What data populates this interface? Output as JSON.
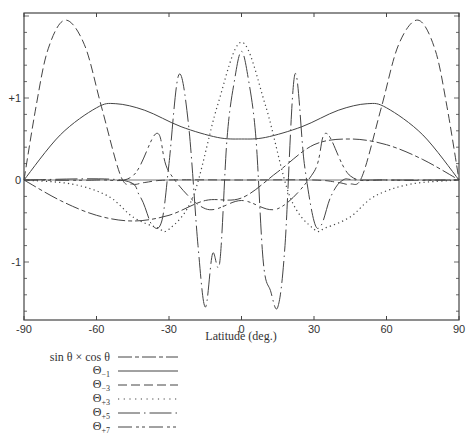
{
  "chart_data": {
    "type": "line",
    "title": "",
    "xlabel": "Latitude (deg.)",
    "ylabel": "",
    "xlim": [
      -90,
      90
    ],
    "ylim": [
      -1.7,
      2.05
    ],
    "grid": false,
    "legend_position": "below-left",
    "x_ticks": [
      -90,
      -60,
      -30,
      0,
      30,
      60,
      90
    ],
    "x_tick_labels": [
      "-90",
      "-60",
      "-30",
      "0",
      "30",
      "60",
      "90"
    ],
    "y_ticks": [
      1,
      0,
      -1
    ],
    "y_tick_labels": [
      "+1",
      "0",
      "-1"
    ],
    "series": [
      {
        "name": "sin θ × cos θ",
        "style": "dash-longshort",
        "x": [
          -90,
          -75,
          -60,
          -45,
          -30,
          -15,
          0,
          15,
          30,
          45,
          60,
          75,
          90
        ],
        "values": [
          0,
          -0.25,
          -0.43,
          -0.5,
          -0.43,
          -0.25,
          -0.22,
          0.1,
          0.43,
          0.5,
          0.43,
          0.25,
          0
        ]
      },
      {
        "name": "Θ₋₁",
        "style": "solid",
        "x": [
          -90,
          -75,
          -60,
          -52,
          -40,
          -25,
          -10,
          0,
          10,
          25,
          40,
          52,
          60,
          75,
          90
        ],
        "values": [
          0,
          0.55,
          0.88,
          0.93,
          0.85,
          0.65,
          0.52,
          0.5,
          0.52,
          0.65,
          0.85,
          0.93,
          0.88,
          0.55,
          0
        ]
      },
      {
        "name": "Θ₋₃",
        "style": "long-dash",
        "x": [
          -90,
          -85,
          -80,
          -73,
          -65,
          -58,
          -50,
          -45,
          -40,
          -30,
          0,
          30,
          40,
          45,
          50,
          58,
          65,
          73,
          80,
          85,
          90
        ],
        "values": [
          0,
          0.9,
          1.6,
          1.95,
          1.65,
          0.9,
          0.05,
          -0.05,
          -0.03,
          0,
          0,
          0,
          -0.03,
          -0.05,
          0.05,
          0.9,
          1.65,
          1.95,
          1.6,
          0.9,
          0
        ]
      },
      {
        "name": "Θ₊₃",
        "style": "dotted",
        "x": [
          -90,
          -70,
          -55,
          -45,
          -35,
          -30,
          -20,
          -10,
          0,
          10,
          20,
          30,
          35,
          45,
          55,
          70,
          90
        ],
        "values": [
          0,
          -0.05,
          -0.2,
          -0.45,
          -0.58,
          -0.6,
          -0.2,
          0.9,
          1.68,
          0.9,
          -0.2,
          -0.6,
          -0.58,
          -0.45,
          -0.2,
          -0.05,
          0
        ]
      },
      {
        "name": "Θ₊₅",
        "style": "dash-dot",
        "x": [
          -90,
          -50,
          -42,
          -37,
          -33,
          -30,
          -26,
          -22,
          -18,
          -15,
          -12,
          -9,
          -6,
          -3,
          0,
          3,
          6,
          9,
          12,
          15,
          18,
          22,
          26,
          30,
          33,
          37,
          42,
          50,
          90
        ],
        "values": [
          0,
          0,
          -0.2,
          -0.55,
          -0.5,
          0.2,
          1.28,
          0.7,
          -0.8,
          -1.55,
          -0.9,
          -1.0,
          0.5,
          1.2,
          1.57,
          1.2,
          0.5,
          -1.0,
          -1.35,
          -1.55,
          -0.8,
          1.28,
          0.2,
          -0.5,
          -0.55,
          -0.2,
          0,
          0,
          0
        ]
      },
      {
        "name": "Θ₊₇",
        "style": "dash-dot-dot",
        "x": [
          -90,
          -60,
          -45,
          -35,
          -30,
          -15,
          0,
          15,
          30,
          35,
          45,
          60,
          90
        ],
        "values": [
          0,
          0,
          0.05,
          0.57,
          0.1,
          -0.35,
          -0.25,
          -0.35,
          0.1,
          0.57,
          0.05,
          0,
          0
        ]
      }
    ]
  },
  "axes": {
    "xlabel": "Latitude (deg.)",
    "x_tick_labels": [
      "-90",
      "-60",
      "-30",
      "0",
      "30",
      "60",
      "90"
    ],
    "y_tick_labels": [
      "+1",
      "0",
      "-1"
    ]
  },
  "legend": {
    "items": [
      {
        "label": "sin θ × cos θ",
        "sub": ""
      },
      {
        "label": "Θ",
        "sub": "−1"
      },
      {
        "label": "Θ",
        "sub": "−3"
      },
      {
        "label": "Θ",
        "sub": "+3"
      },
      {
        "label": "Θ",
        "sub": "+5"
      },
      {
        "label": "Θ",
        "sub": "+7"
      }
    ]
  }
}
